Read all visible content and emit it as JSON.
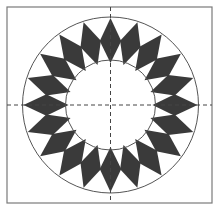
{
  "diagram": {
    "title": "",
    "frame": {
      "x": 7,
      "y": 7,
      "width": 205,
      "height": 196,
      "stroke": "#7a7a7a"
    },
    "center": {
      "x": 110.5,
      "y": 105
    },
    "outer_circle": {
      "r": 88,
      "stroke": "#555555"
    },
    "inner_circle": {
      "r": 45,
      "stroke": "#555555"
    },
    "axes": {
      "style": "dashed",
      "stroke": "#444444"
    },
    "diamonds": {
      "count": 20,
      "angle_step_deg": 18,
      "outer_tip_r": 87,
      "inner_tip_r": 42,
      "side_r": 65,
      "side_half_angle_deg": 9.5,
      "fill": "#3a3a3a"
    }
  }
}
